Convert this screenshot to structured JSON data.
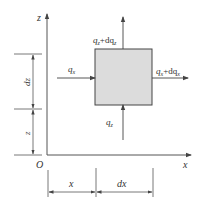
{
  "diagram": {
    "type": "control-volume-flux",
    "colors": {
      "line": "#555555",
      "element_fill": "#dcdcdc",
      "element_stroke": "#444444",
      "text": "#333333"
    },
    "axes": {
      "z_label": "z",
      "x_label": "x",
      "origin_label": "O"
    },
    "element": {
      "fill": "#dcdcdc"
    },
    "fluxes": {
      "top": {
        "label_main": "q",
        "label_sub": "z",
        "label_rest": "+dq",
        "label_rest_sub": "z"
      },
      "left": {
        "label_main": "q",
        "label_sub": "x"
      },
      "right": {
        "label_main": "q",
        "label_sub": "x",
        "label_rest": "+dq",
        "label_rest_sub": "x"
      },
      "bottom": {
        "label_main": "q",
        "label_sub": "z"
      }
    },
    "dimensions": {
      "vertical": [
        {
          "label": "dz"
        },
        {
          "label": "z"
        }
      ],
      "horizontal": [
        {
          "label": "x"
        },
        {
          "label": "dx"
        }
      ]
    }
  }
}
